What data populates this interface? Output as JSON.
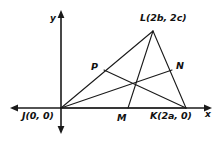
{
  "figure": {
    "type": "coordinate-geometry-diagram",
    "background_color": "#ffffff",
    "stroke_color": "#1a1a1a"
  },
  "axes": {
    "x_axis_label": "x",
    "y_axis_label": "y",
    "origin_pixel": {
      "x": 61,
      "y": 108
    },
    "x_axis_span_pixel": {
      "x1": 10,
      "x2": 212,
      "y": 108
    },
    "y_axis_span_pixel": {
      "y1": 10,
      "y2": 134,
      "x": 61
    },
    "arrows": [
      "left",
      "right",
      "up",
      "down"
    ]
  },
  "points": [
    {
      "id": "J",
      "label": "J(0, 0)",
      "coord_text": "(0, 0)",
      "pixel": {
        "x": 61,
        "y": 108
      },
      "label_pixel": {
        "x": 22,
        "y": 111
      }
    },
    {
      "id": "K",
      "label": "K(2a, 0)",
      "coord_text": "(2a, 0)",
      "pixel": {
        "x": 186,
        "y": 108
      },
      "label_pixel": {
        "x": 150,
        "y": 111
      }
    },
    {
      "id": "L",
      "label": "L(2b, 2c)",
      "coord_text": "(2b, 2c)",
      "pixel": {
        "x": 153,
        "y": 31
      },
      "label_pixel": {
        "x": 140,
        "y": 13
      }
    },
    {
      "id": "M",
      "label": "M",
      "coord_text": "",
      "pixel": {
        "x": 128,
        "y": 108
      },
      "label_pixel": {
        "x": 117,
        "y": 113
      }
    },
    {
      "id": "N",
      "label": "N",
      "coord_text": "",
      "pixel": {
        "x": 172,
        "y": 70
      },
      "label_pixel": {
        "x": 176,
        "y": 61
      }
    },
    {
      "id": "P",
      "label": "P",
      "coord_text": "",
      "pixel": {
        "x": 104,
        "y": 70
      },
      "label_pixel": {
        "x": 91,
        "y": 62
      }
    },
    {
      "id": "centroid",
      "label": "",
      "coord_text": "",
      "pixel": {
        "x": 130,
        "y": 82
      },
      "label_pixel": {
        "x": 130,
        "y": 82
      }
    }
  ],
  "segments": [
    {
      "id": "JL",
      "from": "J",
      "to": "L",
      "name": "side-j-to-l"
    },
    {
      "id": "LK",
      "from": "L",
      "to": "K",
      "name": "side-l-to-k"
    },
    {
      "id": "JK",
      "from": "J",
      "to": "K",
      "name": "side-j-to-k"
    },
    {
      "id": "LM",
      "from": "L",
      "to": "M",
      "name": "median-l-to-m"
    },
    {
      "id": "JN",
      "from": "J",
      "to": "N",
      "name": "median-j-to-n"
    },
    {
      "id": "KP",
      "from": "K",
      "to": "P",
      "name": "median-k-to-p"
    }
  ]
}
